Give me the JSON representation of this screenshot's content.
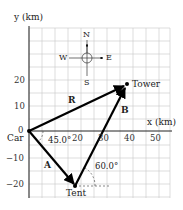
{
  "axes": {
    "y_label": "y (km)",
    "x_label": "x (km)"
  },
  "x_ticks": [
    "20",
    "30",
    "40",
    "50"
  ],
  "y_ticks": [
    "20",
    "10",
    "0",
    "−10",
    "−20"
  ],
  "compass": {
    "n": "N",
    "s": "S",
    "e": "E",
    "w": "W"
  },
  "points": {
    "car": "Car",
    "tent": "Tent",
    "tower": "Tower"
  },
  "vectors": {
    "a": "A",
    "b": "B",
    "r": "R"
  },
  "angles": {
    "a": "45.0°",
    "b": "60.0°"
  }
}
